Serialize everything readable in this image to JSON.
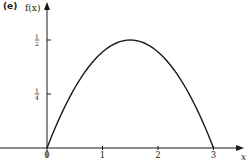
{
  "panel_label": "(e)",
  "chart_data": {
    "type": "line",
    "title": "",
    "xlabel": "x",
    "ylabel": "f(x)",
    "xlim": [
      0,
      3.5
    ],
    "ylim": [
      0,
      0.6
    ],
    "grid": false,
    "legend": null,
    "x_ticks": [
      {
        "value": 0,
        "label": "0"
      },
      {
        "value": 1,
        "label": "1"
      },
      {
        "value": 2,
        "label": "2"
      },
      {
        "value": 3,
        "label": "3"
      }
    ],
    "y_ticks": [
      {
        "value": 0.25,
        "label_num": "1",
        "label_den": "4"
      },
      {
        "value": 0.5,
        "label_num": "1",
        "label_den": "2"
      }
    ],
    "series": [
      {
        "name": "f(x)",
        "x": [
          0,
          0.25,
          0.5,
          0.75,
          1.0,
          1.25,
          1.5,
          1.75,
          2.0,
          2.25,
          2.5,
          2.75,
          3.0
        ],
        "values": [
          0,
          0.153,
          0.278,
          0.375,
          0.444,
          0.486,
          0.5,
          0.486,
          0.444,
          0.375,
          0.278,
          0.153,
          0
        ]
      }
    ],
    "color": "#1a1a1a"
  }
}
